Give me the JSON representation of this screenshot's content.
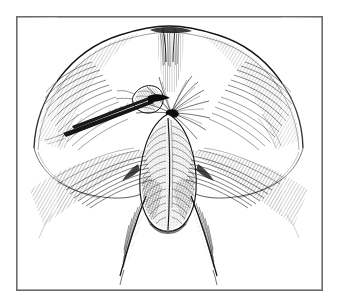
{
  "figure": {
    "kind": "line-art-illustration",
    "technique": "pen-and-ink hatching / engraving",
    "caption": "",
    "title": "",
    "alt_text": "Black and white pen-and-ink surgical illustration inside a thin rectangular frame"
  },
  "canvas": {
    "width": 337,
    "height": 305,
    "background_color": "#ffffff"
  },
  "frame": {
    "name": "plate-border",
    "x": 16,
    "y": 16,
    "width": 307,
    "height": 275,
    "stroke_color": "#6b6b6b",
    "stroke_width": 1.6,
    "fill_color": "#ffffff"
  },
  "palette": {
    "ink": "#121212",
    "ink_mid": "#3a3a3a",
    "ink_light": "#6f6f6f",
    "paper": "#ffffff",
    "frame": "#6b6b6b"
  },
  "elements": {
    "dome_outline": {
      "label": "abdominal / buttock dome contour",
      "description": "broad arched contour spanning the upper two thirds of the plate"
    },
    "median_cleft": {
      "label": "top central cleft",
      "description": "short vertical notch with dense hatching at the apex of the dome"
    },
    "left_lobe": {
      "label": "left lobe shading",
      "description": "curved hatch bands following the inner left contour"
    },
    "right_lobe": {
      "label": "right lobe shading",
      "description": "curved hatch bands following the inner right contour"
    },
    "central_body": {
      "label": "scrotum",
      "description": "pendulous elongated sac in the centre, stippled and cross hatched"
    },
    "raphe": {
      "label": "median raphe",
      "description": "vertical midline seam dividing the central sac"
    },
    "small_oval": {
      "label": "everted tissue flap",
      "description": "small rounded structure held to the left of the midline apex"
    },
    "instrument": {
      "label": "surgical instrument",
      "description": "slender forceps / scissors entering from the lower left and gripping the tissue flap"
    },
    "radiating_burst": {
      "label": "radiating incision lines",
      "description": "fan of fine lines emanating from the apex of the scrotum"
    },
    "left_thigh": {
      "label": "left thigh fold",
      "description": "long tapering line descending to the lower left with hatch shading"
    },
    "right_thigh": {
      "label": "right thigh fold",
      "description": "long tapering line descending to the lower right with hatch shading"
    },
    "left_groin_sweep": {
      "label": "left groin hatching",
      "description": "sweeping fan of hatch strokes across the left groin"
    },
    "right_groin_sweep": {
      "label": "right groin hatching",
      "description": "sweeping fan of hatch strokes across the right groin"
    }
  }
}
